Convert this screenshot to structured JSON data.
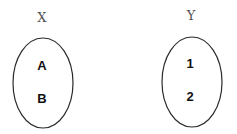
{
  "diagram": {
    "type": "set-mapping",
    "sets": [
      {
        "name": "X",
        "elements": [
          "A",
          "B"
        ]
      },
      {
        "name": "Y",
        "elements": [
          "1",
          "2"
        ]
      }
    ],
    "colors": {
      "background": "#ffffff",
      "ellipse_stroke": "#2a2a2a",
      "title_text": "#555555",
      "element_text": "#111111"
    }
  }
}
